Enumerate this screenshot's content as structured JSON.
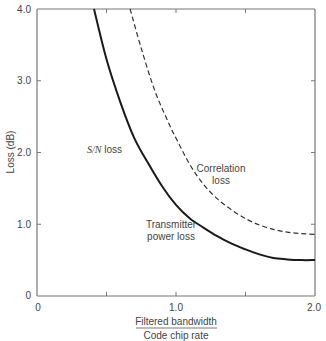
{
  "chart_data": {
    "type": "line",
    "title": "",
    "xlabel_numerator": "Filtered bandwidth",
    "xlabel_denominator": "Code chip rate",
    "ylabel": "Loss (dB)",
    "xlim": [
      0,
      2.0
    ],
    "ylim": [
      0,
      4.0
    ],
    "grid": false,
    "x_tick_labels": [
      "0",
      "1.0",
      "2.0"
    ],
    "x_minor_ticks": [
      0.5,
      1.5
    ],
    "y_tick_labels": [
      "0",
      "1.0",
      "2.0",
      "3.0",
      "4.0"
    ],
    "series": [
      {
        "name": "Transmitter power loss / S/N loss",
        "style": "solid",
        "x": [
          0.41,
          0.5,
          0.6,
          0.7,
          0.8,
          0.9,
          1.0,
          1.1,
          1.2,
          1.3,
          1.4,
          1.5,
          1.6,
          1.7,
          1.8,
          1.9,
          2.0
        ],
        "y": [
          4.0,
          3.3,
          2.7,
          2.2,
          1.85,
          1.53,
          1.27,
          1.08,
          0.95,
          0.83,
          0.73,
          0.65,
          0.58,
          0.53,
          0.51,
          0.5,
          0.5
        ]
      },
      {
        "name": "Correlation loss",
        "style": "dashed",
        "x": [
          0.67,
          0.75,
          0.85,
          0.95,
          1.0,
          1.1,
          1.2,
          1.3,
          1.4,
          1.5,
          1.6,
          1.7,
          1.8,
          1.9,
          2.0
        ],
        "y": [
          4.0,
          3.45,
          2.85,
          2.4,
          2.2,
          1.83,
          1.55,
          1.35,
          1.2,
          1.08,
          0.99,
          0.93,
          0.89,
          0.87,
          0.86
        ]
      }
    ],
    "annotations": [
      {
        "text": "S/N loss",
        "italic_part": "S/N",
        "x": 0.62,
        "y": 2.0
      },
      {
        "text": "Correlation loss",
        "x": 1.32,
        "y": 1.55
      },
      {
        "text": "Transmitter power loss",
        "x": 0.95,
        "y": 0.9
      }
    ]
  },
  "labels": {
    "y_axis": "Loss (dB)",
    "x_num": "Filtered bandwidth",
    "x_den": "Code chip rate",
    "sn_italic": "S/N",
    "sn_rest": " loss",
    "corr_1": "Correlation",
    "corr_2": "loss",
    "tx_1": "Transmitter",
    "tx_2": "power loss",
    "yt0": "0",
    "yt1": "1.0",
    "yt2": "2.0",
    "yt3": "3.0",
    "yt4": "4.0",
    "xt0": "0",
    "xt1": "1.0",
    "xt2": "2.0"
  }
}
